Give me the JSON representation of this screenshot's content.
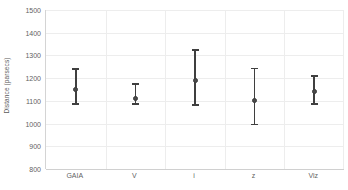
{
  "chart_data": {
    "type": "scatter",
    "title": "",
    "xlabel": "",
    "ylabel": "Distance (parsecs)",
    "categories": [
      "GAIA",
      "V",
      "i",
      "z",
      "Viz"
    ],
    "values": [
      1150,
      1110,
      1190,
      1100,
      1140
    ],
    "error_upper": [
      1243,
      1177,
      1327,
      1246,
      1213
    ],
    "error_lower": [
      1082,
      1082,
      1078,
      993,
      1082
    ],
    "series": [
      {
        "name": "Distance",
        "values": [
          1150,
          1110,
          1190,
          1100,
          1140
        ]
      }
    ],
    "points": [
      {
        "category": "GAIA",
        "value": 1150,
        "upper": 1243,
        "lower": 1082
      },
      {
        "category": "V",
        "value": 1110,
        "upper": 1177,
        "lower": 1082
      },
      {
        "category": "i",
        "value": 1190,
        "upper": 1327,
        "lower": 1078
      },
      {
        "category": "z",
        "value": 1100,
        "upper": 1246,
        "lower": 993
      },
      {
        "category": "Viz",
        "value": 1140,
        "upper": 1213,
        "lower": 1082
      }
    ],
    "ylim": [
      800,
      1500
    ],
    "yticks": [
      800,
      900,
      1000,
      1100,
      1200,
      1300,
      1400,
      1500
    ],
    "ytick_labels": [
      "800",
      "900",
      "1000",
      "1100",
      "1200",
      "1300",
      "1400",
      "1500"
    ],
    "grid": {
      "horizontal": true,
      "vertical": true
    },
    "legend": {
      "visible": false,
      "position": "none"
    },
    "marker_color": "#4a4a4a",
    "errorbar_color": "#3f3f3f",
    "gridline_color": "#ededed",
    "axis_color": "#d0d0d0",
    "background_color": "#ffffff"
  }
}
